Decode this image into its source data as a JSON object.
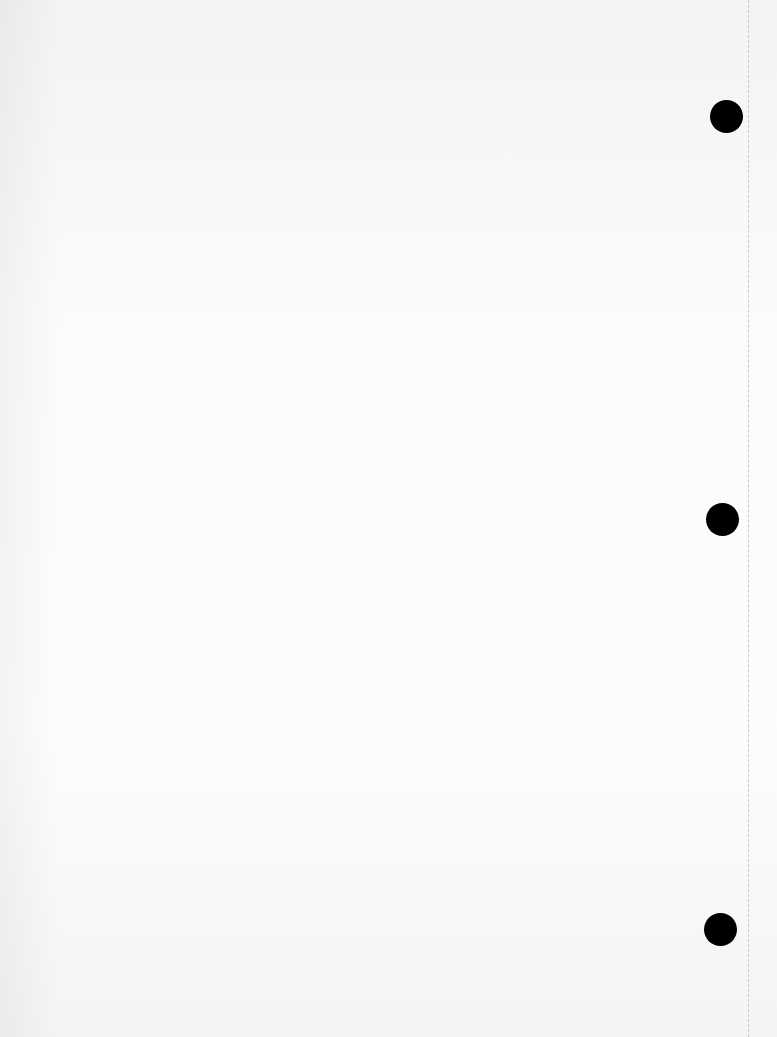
{
  "page": {
    "background": "#fbfbfb",
    "holes": [
      {
        "cx": 726,
        "cy": 116
      },
      {
        "cx": 722,
        "cy": 519
      },
      {
        "cx": 720,
        "cy": 929
      }
    ],
    "hole_color": "#000000",
    "perforation_x": 748
  }
}
